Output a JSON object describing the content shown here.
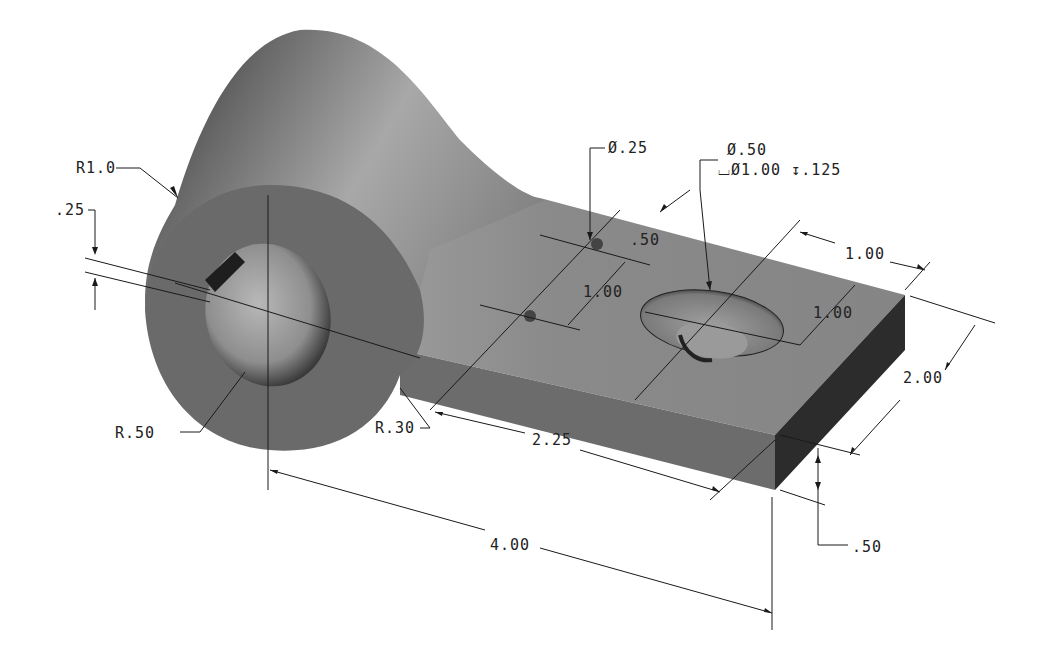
{
  "drawing": {
    "title": "Isometric part drawing - clevis bracket",
    "colors": {
      "background": "#ffffff",
      "body_top": "#8a8a8a",
      "body_front": "#6e6e6e",
      "body_end": "#2c2c2c",
      "cylinder_light": "#a5a5a5",
      "cylinder_dark": "#3a3a3a",
      "line": "#1a1a1a"
    }
  },
  "dimensions": {
    "cyl_radius": "R1.0",
    "slot_width": ".25",
    "bore_radius": "R.50",
    "fillet_radius": "R.30",
    "small_hole_dia": "Ø.25",
    "large_hole_dia": "Ø.50",
    "counterbore": "⌴Ø1.00 ↧.125",
    "small_hole_spacing_label": ".50",
    "small_hole_offset": "1.00",
    "large_hole_from_end": "1.00",
    "large_hole_from_edge": "1.00",
    "plate_width": "2.00",
    "plate_len_from_fillet": "2.25",
    "overall_length": "4.00",
    "plate_thickness": ".50"
  }
}
